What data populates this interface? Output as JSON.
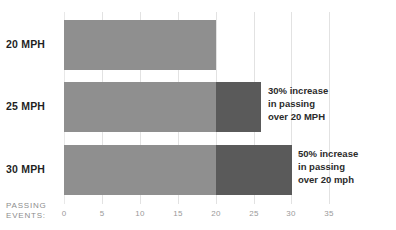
{
  "chart_data": {
    "type": "bar",
    "orientation": "horizontal",
    "stacked": true,
    "title": "",
    "subtitle": "",
    "xlabel": "PASSING EVENTS:",
    "ylabel": "",
    "xlim": [
      0,
      36
    ],
    "grid": true,
    "legend": "none",
    "categories": [
      "20 MPH",
      "25 MPH",
      "30 MPH"
    ],
    "x_ticks": [
      0,
      5,
      10,
      15,
      20,
      25,
      30,
      35
    ],
    "series": [
      {
        "name": "baseline passing events",
        "values": [
          20,
          20,
          20
        ],
        "color": "#8f8f8f"
      },
      {
        "name": "additional passing events",
        "values": [
          0,
          6,
          10
        ],
        "color": "#5a5a5a"
      }
    ],
    "totals": [
      20,
      26,
      30
    ],
    "annotations": [
      {
        "category": "25 MPH",
        "lines": [
          "30% increase",
          "in passing",
          "over 20 MPH"
        ]
      },
      {
        "category": "30 MPH",
        "lines": [
          "50% increase",
          "in passing",
          "over 20 mph"
        ]
      }
    ]
  },
  "axis": {
    "caption_lines": [
      "PASSING",
      "EVENTS:"
    ],
    "tick_labels": [
      "0",
      "5",
      "10",
      "15",
      "20",
      "25",
      "30",
      "35"
    ]
  },
  "colors": {
    "bar_base": "#8f8f8f",
    "bar_extra": "#5a5a5a",
    "bar_cap": "#161616",
    "gridline": "#e2e2e2",
    "tick_text": "#9a9a9a",
    "label_text": "#1f1f1f",
    "annotation_text": "#2b2b2b",
    "background": "#ffffff"
  }
}
